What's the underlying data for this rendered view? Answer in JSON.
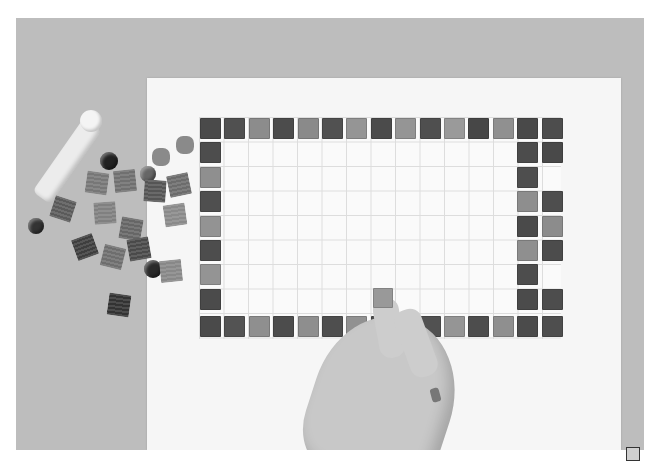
{
  "image": {
    "subject": "Hand placing glass mosaic tiles in a rectangular border on a gridded sheet",
    "tone": "grayscale"
  },
  "border": {
    "top_row": [
      "#4a4a4a",
      "#505050",
      "#8c8c8c",
      "#4c4c4c",
      "#8a8a8a",
      "#515151",
      "#959595",
      "#4b4b4b",
      "#959595",
      "#4f4f4f",
      "#9a9a9a",
      "#474747",
      "#909090",
      "#494949",
      "#4d4d4d"
    ],
    "bottom_row": [
      "#4a4a4a",
      "#535353",
      "#8f8f8f",
      "#4c4c4c",
      "#8e8e8e",
      "#4e4e4e",
      "#919191",
      "#4c4c4c",
      "#959595",
      "#515151",
      "#959595",
      "#4d4d4d",
      "#8f8f8f",
      "#4b4b4b",
      "#4e4e4e"
    ],
    "left_col": [
      "#4d4d4d",
      "#8f8f8f",
      "#4f4f4f",
      "#939393",
      "#4d4d4d",
      "#949494",
      "#4b4b4b"
    ]
  },
  "corner_marker": {
    "color": "#cfcfcf"
  }
}
